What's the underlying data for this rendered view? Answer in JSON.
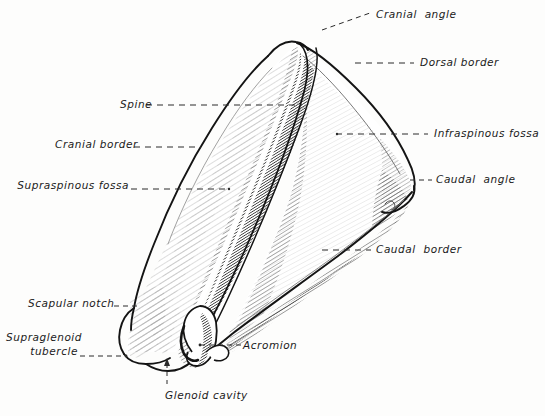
{
  "figure": {
    "subject": "scapula",
    "background_color": "#fdfdfc",
    "ink_color": "#1a1a1a",
    "width": 545,
    "height": 416
  },
  "labels": [
    {
      "id": "cranial-angle",
      "text": "Cranial  angle",
      "side": "right",
      "x": 376,
      "y": 8,
      "leader": {
        "type": "dashed",
        "points": "330,28 345,22 362,16"
      }
    },
    {
      "id": "dorsal-border",
      "text": "Dorsal border",
      "side": "right",
      "x": 420,
      "y": 56,
      "leader": {
        "type": "dashed",
        "points": "359,63 415,63"
      }
    },
    {
      "id": "infraspinous-fossa",
      "text": "Infraspinous fossa",
      "side": "right",
      "x": 434,
      "y": 127,
      "leader": {
        "type": "dashed",
        "points": "338,139 428,139"
      }
    },
    {
      "id": "caudal-angle",
      "text": "Caudal  angle",
      "side": "right",
      "x": 436,
      "y": 173,
      "leader": {
        "type": "dashed",
        "points": "414,186 430,186"
      }
    },
    {
      "id": "caudal-border",
      "text": "Caudal  border",
      "side": "right",
      "x": 376,
      "y": 243,
      "leader": {
        "type": "dashed",
        "points": "325,255 371,255"
      }
    },
    {
      "id": "spine",
      "text": "Spine",
      "side": "left",
      "x": 120,
      "y": 98,
      "leader": {
        "type": "dashed",
        "points": "125,110 300,110"
      }
    },
    {
      "id": "cranial-border",
      "text": "Cranial border",
      "side": "left",
      "x": 135,
      "y": 138,
      "leader": {
        "type": "dashed",
        "points": "137,150 197,150"
      }
    },
    {
      "id": "supraspinous-fossa",
      "text": "Supraspinous fossa",
      "side": "left",
      "x": 145,
      "y": 179,
      "leader": {
        "type": "dashed",
        "points": "133,191 228,191"
      }
    },
    {
      "id": "scapular-notch",
      "text": "Scapular notch",
      "side": "left",
      "x": 118,
      "y": 297,
      "leader": {
        "type": "dashed",
        "points": "116,309 138,309"
      }
    },
    {
      "id": "supraglenoid-tubercle",
      "text": "Supraglenoid\ntubercle",
      "side": "left",
      "x": 92,
      "y": 331,
      "leader": {
        "type": "dashed",
        "points": "79,358 125,358"
      }
    },
    {
      "id": "acromion",
      "text": "Acromion",
      "side": "right",
      "x": 243,
      "y": 339,
      "leader": {
        "type": "dashed",
        "points": "200,348 240,348"
      }
    },
    {
      "id": "glenoid-cavity",
      "text": "Glenoid cavity",
      "side": "right",
      "x": 165,
      "y": 390,
      "leader": {
        "type": "dashed-arrow",
        "points": "168,385 168,360"
      }
    }
  ],
  "annotations": {
    "caudal_angle_mark": "small curved tick near caudal angle"
  }
}
